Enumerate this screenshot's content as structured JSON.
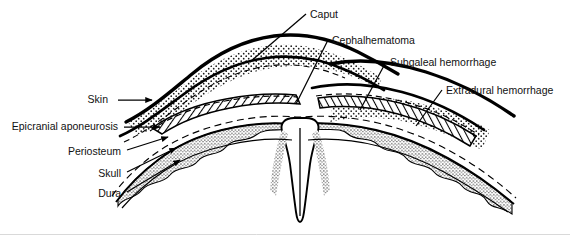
{
  "figure": {
    "background_color": "#ffffff",
    "ink_color": "#000000",
    "width": 570,
    "height": 237
  },
  "labels": {
    "left": [
      {
        "id": "skin",
        "text": "Skin",
        "x": 108,
        "y": 95,
        "align": "right",
        "leader": "arrow-right"
      },
      {
        "id": "aponeurosis",
        "text": "Epicranial aponeurosis",
        "x": 12,
        "y": 121,
        "align": "right",
        "leader": "arrow-right"
      },
      {
        "id": "periosteum",
        "text": "Periosteum",
        "x": 59,
        "y": 147,
        "align": "right",
        "leader": "line-up-right"
      },
      {
        "id": "skull",
        "text": "Skull",
        "x": 88,
        "y": 169,
        "align": "right",
        "leader": "arrow-up-right"
      },
      {
        "id": "dura",
        "text": "Dura",
        "x": 89,
        "y": 189,
        "align": "right",
        "leader": "arrow-up-right"
      }
    ],
    "right": [
      {
        "id": "caput",
        "text": "Caput",
        "x": 310,
        "y": 10,
        "leader": "line-down-left"
      },
      {
        "id": "cephalhematoma",
        "text": "Cephalhematoma",
        "x": 332,
        "y": 36,
        "leader": "line-down-left"
      },
      {
        "id": "subgaleal",
        "text": "Subgaleal hemorrhage",
        "x": 390,
        "y": 58,
        "leader": "line-down-left"
      },
      {
        "id": "extradural",
        "text": "Extradural hemorrhage",
        "x": 446,
        "y": 86,
        "leader": "line-down-left"
      }
    ]
  },
  "regions": {
    "caput_fill": "stipple-coarse",
    "cephalhematoma_fill": "diagonal-hatch",
    "subgaleal_fill": "stipple-coarse",
    "extradural_fill": "diagonal-hatch",
    "skull_fill": "stipple-fine",
    "skin_stroke_width": 3.2,
    "aponeurosis_stroke_width": 2.6,
    "periosteum_stroke": "dashed"
  }
}
